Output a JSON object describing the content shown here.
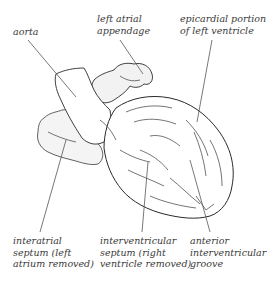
{
  "diagram": {
    "labels": [
      {
        "id": "aorta",
        "lines": [
          "aorta"
        ]
      },
      {
        "id": "left-atrial-appendage",
        "lines": [
          "left atrial",
          "appendage"
        ]
      },
      {
        "id": "epicardial-portion-left-ventricle",
        "lines": [
          "epicardial portion",
          "of left ventricle"
        ]
      },
      {
        "id": "interatrial-septum",
        "lines": [
          "interatrial",
          "septum (left",
          "atrium removed)"
        ]
      },
      {
        "id": "interventricular-septum",
        "lines": [
          "interventricular",
          "septum (right",
          "ventricle removed)"
        ]
      },
      {
        "id": "anterior-interventricular-groove",
        "lines": [
          "anterior",
          "interventricular",
          "groove"
        ]
      }
    ],
    "colors": {
      "line": "#555555",
      "outline": "#2a2a2a",
      "text": "#3a3a3a",
      "background": "#ffffff"
    }
  }
}
